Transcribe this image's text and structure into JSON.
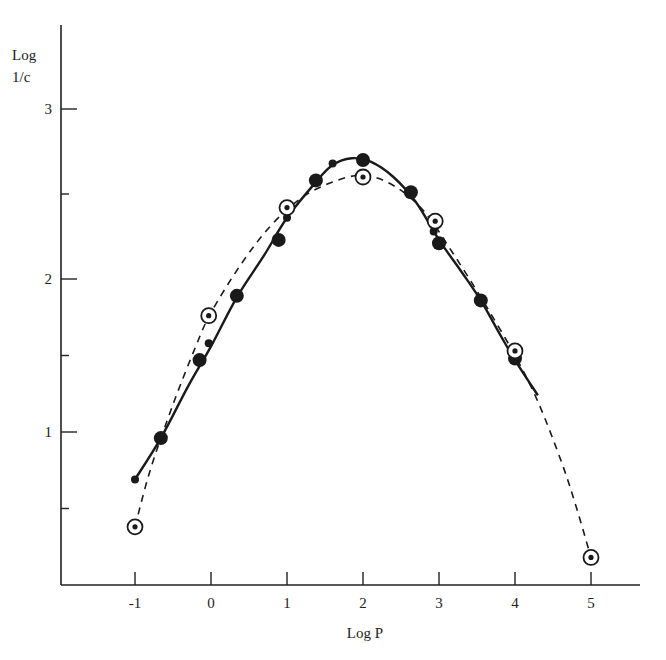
{
  "chart_data": {
    "type": "scatter",
    "title": "",
    "xlabel": "Log P",
    "ylabel": "Log 1/c",
    "ylabel_lines": [
      "Log",
      "1/c"
    ],
    "xlim": [
      -2,
      5.6
    ],
    "ylim": [
      0,
      3.5
    ],
    "x_ticks": [
      -1,
      0,
      1,
      2,
      3,
      4,
      5
    ],
    "y_ticks_labeled": [
      1,
      2,
      3
    ],
    "y_ticks_minor": [
      0.5,
      1.5,
      2.5
    ],
    "grid": false,
    "legend": null,
    "series": [
      {
        "name": "large filled circles",
        "marker": "filled-large",
        "points": [
          [
            -0.66,
            0.96
          ],
          [
            -0.15,
            1.47
          ],
          [
            0.34,
            1.89
          ],
          [
            0.89,
            2.23
          ],
          [
            1.38,
            2.58
          ],
          [
            2.0,
            2.7
          ],
          [
            2.63,
            2.51
          ],
          [
            3.0,
            2.21
          ],
          [
            3.55,
            1.86
          ],
          [
            4.0,
            1.48
          ]
        ]
      },
      {
        "name": "small filled circles",
        "marker": "filled-small",
        "points": [
          [
            -1.0,
            0.69
          ],
          [
            -0.03,
            1.58
          ],
          [
            1.0,
            2.36
          ],
          [
            1.6,
            2.68
          ],
          [
            2.93,
            2.28
          ]
        ]
      },
      {
        "name": "open circles with dot",
        "marker": "open-dot",
        "points": [
          [
            -1.0,
            0.38
          ],
          [
            -0.03,
            1.76
          ],
          [
            1.0,
            2.42
          ],
          [
            2.0,
            2.6
          ],
          [
            2.95,
            2.34
          ],
          [
            4.0,
            1.53
          ],
          [
            5.0,
            0.18
          ]
        ]
      }
    ],
    "curves": [
      {
        "name": "solid fit",
        "style": "solid",
        "points": [
          [
            -1.0,
            0.69
          ],
          [
            -0.66,
            0.96
          ],
          [
            -0.3,
            1.3
          ],
          [
            0.0,
            1.56
          ],
          [
            0.34,
            1.88
          ],
          [
            0.7,
            2.14
          ],
          [
            1.0,
            2.36
          ],
          [
            1.38,
            2.57
          ],
          [
            1.6,
            2.67
          ],
          [
            1.85,
            2.71
          ],
          [
            2.1,
            2.69
          ],
          [
            2.4,
            2.6
          ],
          [
            2.7,
            2.45
          ],
          [
            3.0,
            2.23
          ],
          [
            3.3,
            2.04
          ],
          [
            3.55,
            1.86
          ],
          [
            3.8,
            1.64
          ],
          [
            4.0,
            1.47
          ],
          [
            4.3,
            1.24
          ]
        ]
      },
      {
        "name": "dashed fit",
        "style": "dashed",
        "points": [
          [
            -1.0,
            0.38
          ],
          [
            -0.8,
            0.75
          ],
          [
            -0.5,
            1.18
          ],
          [
            -0.2,
            1.56
          ],
          [
            0.0,
            1.78
          ],
          [
            0.4,
            2.09
          ],
          [
            0.8,
            2.32
          ],
          [
            1.2,
            2.48
          ],
          [
            1.6,
            2.57
          ],
          [
            2.0,
            2.61
          ],
          [
            2.4,
            2.55
          ],
          [
            2.8,
            2.4
          ],
          [
            3.2,
            2.14
          ],
          [
            3.6,
            1.84
          ],
          [
            4.0,
            1.5
          ],
          [
            4.3,
            1.2
          ],
          [
            4.6,
            0.82
          ],
          [
            4.8,
            0.52
          ],
          [
            5.0,
            0.18
          ]
        ]
      }
    ]
  }
}
